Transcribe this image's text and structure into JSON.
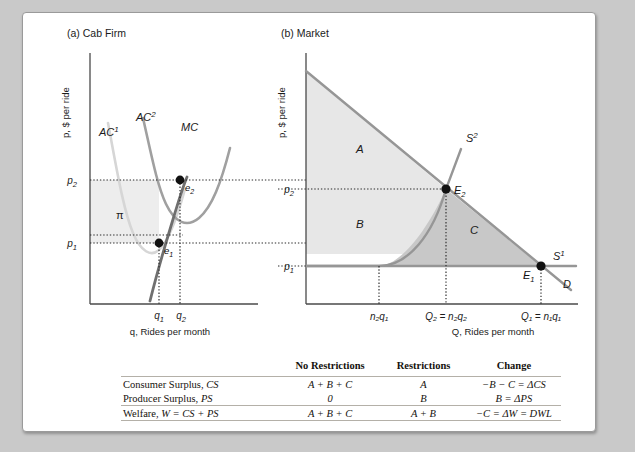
{
  "panel_a": {
    "title": "(a) Cab Firm",
    "y_axis_label": "p, $ per ride",
    "x_axis_label": "q, Rides per month",
    "curves": [
      {
        "name": "AC1",
        "label": "AC",
        "superscript": "1",
        "color": "#d2d2d2"
      },
      {
        "name": "AC2",
        "label": "AC",
        "superscript": "2",
        "color": "#9a9a9a"
      },
      {
        "name": "MC",
        "label": "MC",
        "superscript": "",
        "color": "#6e6e6e"
      }
    ],
    "price_ticks": [
      {
        "label": "p",
        "subscript": "2"
      },
      {
        "label": "p",
        "subscript": "1"
      }
    ],
    "quantity_ticks": [
      {
        "label": "q",
        "subscript": "1"
      },
      {
        "label": "q",
        "subscript": "2"
      }
    ],
    "equilibria": [
      {
        "label": "e",
        "subscript": "2"
      },
      {
        "label": "e",
        "subscript": "1"
      }
    ],
    "profit_region_label": "π"
  },
  "panel_b": {
    "title": "(b) Market",
    "y_axis_label": "p, $ per ride",
    "x_axis_label": "Q, Rides per month",
    "curves": [
      {
        "name": "S2",
        "label": "S",
        "superscript": "2",
        "color": "#8f8f8f"
      },
      {
        "name": "S1",
        "label": "S",
        "superscript": "1",
        "color": "#8f8f8f"
      },
      {
        "name": "D",
        "label": "D",
        "superscript": "",
        "color": "#8f8f8f"
      }
    ],
    "price_ticks": [
      {
        "label": "p",
        "subscript": "2"
      },
      {
        "label": "p",
        "subscript": "1"
      }
    ],
    "quantity_ticks": [
      {
        "text": "n₂q₁"
      },
      {
        "text": "Q₂ = n₂q₂"
      },
      {
        "text": "Q₁ = n₁q₁"
      }
    ],
    "equilibria": [
      {
        "label": "E",
        "subscript": "2"
      },
      {
        "label": "E",
        "subscript": "1"
      }
    ],
    "regions": [
      {
        "label": "A",
        "color": "#e6e6e6"
      },
      {
        "label": "B",
        "color": "#e6e6e6"
      },
      {
        "label": "C",
        "color": "#c6c6c6"
      }
    ]
  },
  "table": {
    "columns": [
      "",
      "No Restrictions",
      "Restrictions",
      "Change"
    ],
    "rows": [
      {
        "head_plain": "Consumer Surplus, ",
        "head_italic": "CS",
        "no_restrictions": "A + B + C",
        "restrictions": "A",
        "change": "−B − C = ΔCS"
      },
      {
        "head_plain": "Producer Surplus, ",
        "head_italic": "PS",
        "no_restrictions": "0",
        "restrictions": "B",
        "change": "B = ΔPS"
      },
      {
        "head_plain": "Welfare, ",
        "head_italic": "W = CS + PS",
        "no_restrictions": "A + B + C",
        "restrictions": "A + B",
        "change": "−C = ΔW = DWL"
      }
    ]
  }
}
